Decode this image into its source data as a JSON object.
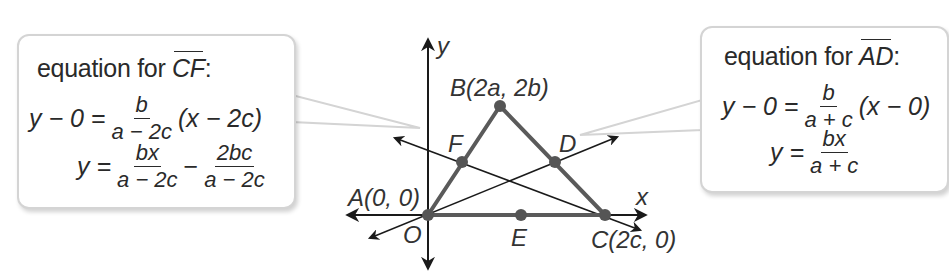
{
  "left_callout": {
    "title_prefix": "equation for ",
    "title_line": "CF",
    "title_suffix": ":",
    "eq1": {
      "lhs": "y − 0 =",
      "num": "b",
      "den": "a − 2c",
      "rhs": "(x − 2c)"
    },
    "eq2": {
      "lhs": "y =",
      "num1": "bx",
      "den1": "a − 2c",
      "op": "−",
      "num2": "2bc",
      "den2": "a − 2c"
    }
  },
  "right_callout": {
    "title_prefix": "equation for ",
    "title_line": "AD",
    "title_suffix": ":",
    "eq1": {
      "lhs": "y − 0 =",
      "num": "b",
      "den": "a + c",
      "rhs": "(x − 0)"
    },
    "eq2": {
      "lhs": "y =",
      "num": "bx",
      "den": "a + c"
    }
  },
  "diagram": {
    "axis_labels": {
      "x": "x",
      "y": "y"
    },
    "points": {
      "A": "A(0, 0)",
      "B": "B(2a, 2b)",
      "C": "C(2c, 0)",
      "D": "D",
      "E": "E",
      "F": "F",
      "O": "O"
    }
  },
  "colors": {
    "triangle": "#555555",
    "lines": "#1a1a1a",
    "callout_border": "#d4d4d4"
  }
}
